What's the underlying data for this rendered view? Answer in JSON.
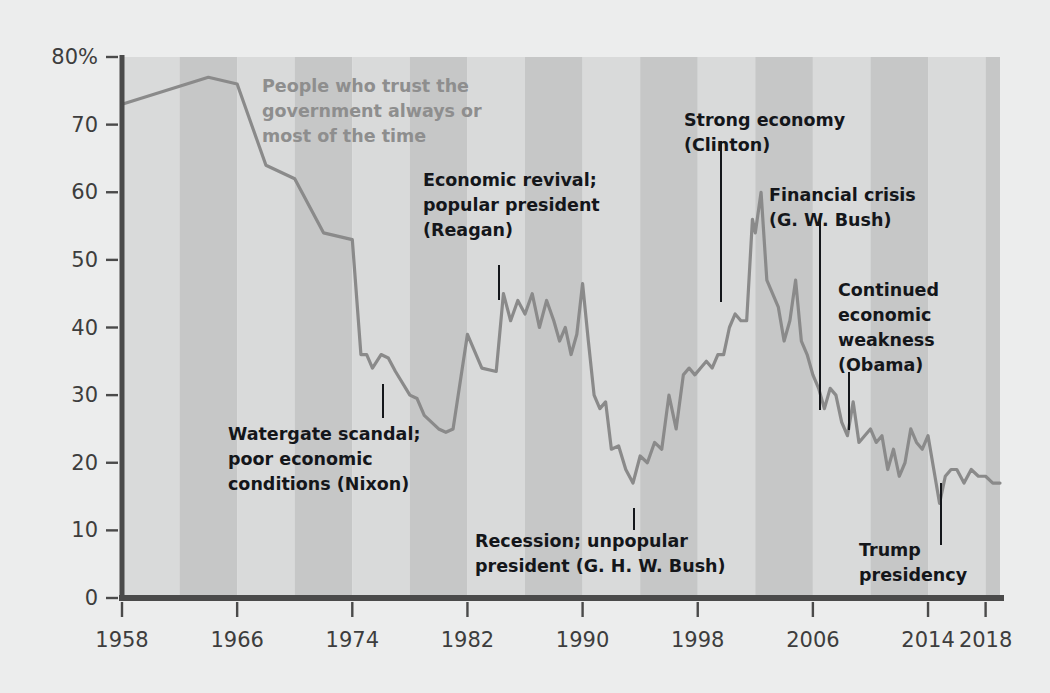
{
  "figure": {
    "background_color": "#eceded",
    "plot_band_light": "#d9dada",
    "plot_band_dark": "#c6c7c7",
    "line_color": "#8a8a8a",
    "axis_color": "#4a4a4a",
    "annotation_color": "#14161a",
    "series_label_color": "#8e8e8e"
  },
  "series_label": {
    "line1": "People who trust the",
    "line2": "government always or",
    "line3": "most of the time"
  },
  "annotations": [
    {
      "id": "watergate",
      "lines": [
        "Watergate scandal;",
        "poor economic",
        "conditions (Nixon)"
      ],
      "anchor_year": 1974.5,
      "anchor_value": 34,
      "text_x": 228,
      "text_y": 440,
      "align": "start",
      "leader": {
        "x": 383,
        "y1": 384,
        "y2": 418
      }
    },
    {
      "id": "reagan",
      "lines": [
        "Economic revival;",
        "popular president",
        "(Reagan)"
      ],
      "anchor_year": 1984,
      "anchor_value": 45,
      "text_x": 423,
      "text_y": 186,
      "align": "start",
      "leader": {
        "x": 499,
        "y1": 265,
        "y2": 300
      }
    },
    {
      "id": "ghw-bush",
      "lines": [
        "Recession; unpopular",
        "president (G. H. W. Bush)"
      ],
      "anchor_year": 1994,
      "anchor_value": 18,
      "text_x": 475,
      "text_y": 547,
      "align": "start",
      "leader": {
        "x": 634,
        "y1": 508,
        "y2": 530
      }
    },
    {
      "id": "clinton",
      "lines": [
        "Strong economy",
        "(Clinton)"
      ],
      "anchor_year": 2000,
      "anchor_value": 42,
      "text_x": 684,
      "text_y": 126,
      "align": "start",
      "leader": {
        "x": 721,
        "y1": 141,
        "y2": 302
      }
    },
    {
      "id": "gw-bush",
      "lines": [
        "Financial crisis",
        "(G. W. Bush)"
      ],
      "anchor_year": 2007,
      "anchor_value": 27,
      "text_x": 769,
      "text_y": 201,
      "align": "start",
      "leader": {
        "x": 820,
        "y1": 218,
        "y2": 410
      }
    },
    {
      "id": "obama",
      "lines": [
        "Continued",
        "economic",
        "weakness",
        "(Obama)"
      ],
      "anchor_year": 2010,
      "anchor_value": 24,
      "text_x": 838,
      "text_y": 296,
      "align": "start",
      "leader": {
        "x": 849,
        "y1": 372,
        "y2": 430
      }
    },
    {
      "id": "trump",
      "lines": [
        "Trump",
        "presidency"
      ],
      "anchor_year": 2016,
      "anchor_value": 18,
      "text_x": 859,
      "text_y": 556,
      "align": "start",
      "leader": {
        "x": 941,
        "y1": 483,
        "y2": 545
      }
    }
  ],
  "chart_data": {
    "type": "line",
    "title": "",
    "subtitle": "",
    "xlabel": "",
    "ylabel": "",
    "ylim": [
      0,
      80
    ],
    "xlim": [
      1958,
      2019
    ],
    "grid": false,
    "legend_position": "inline-label",
    "y_ticks": [
      0,
      10,
      20,
      30,
      40,
      50,
      60,
      70,
      80
    ],
    "y_tick_labels": [
      "0",
      "10",
      "20",
      "30",
      "40",
      "50",
      "60",
      "70",
      "80%"
    ],
    "x_ticks": [
      1958,
      1966,
      1974,
      1982,
      1990,
      1998,
      2006,
      2014,
      2018
    ],
    "x_tick_labels": [
      "1958",
      "1966",
      "1974",
      "1982",
      "1990",
      "1998",
      "2006",
      "2014",
      "2018"
    ],
    "band_boundaries": [
      1958,
      1962,
      1966,
      1970,
      1974,
      1978,
      1982,
      1986,
      1990,
      1994,
      1998,
      2002,
      2006,
      2010,
      2014,
      2018,
      2019
    ],
    "series": [
      {
        "name": "People who trust the government always or most of the time",
        "color": "#8a8a8a",
        "x": [
          1958,
          1964,
          1966,
          1968,
          1970,
          1972,
          1974,
          1974.6,
          1975,
          1975.4,
          1976,
          1976.5,
          1977,
          1978,
          1978.5,
          1979,
          1980,
          1980.5,
          1981,
          1982,
          1983,
          1984,
          1984.5,
          1985,
          1985.5,
          1986,
          1986.5,
          1987,
          1987.5,
          1988,
          1988.4,
          1988.8,
          1989.2,
          1989.6,
          1990,
          1990.4,
          1990.8,
          1991.2,
          1991.6,
          1992,
          1992.5,
          1993,
          1993.5,
          1994,
          1994.5,
          1995,
          1995.5,
          1996,
          1996.5,
          1997,
          1997.4,
          1997.8,
          1998.2,
          1998.6,
          1999,
          1999.4,
          1999.8,
          2000.2,
          2000.6,
          2001,
          2001.4,
          2001.8,
          2002,
          2002.4,
          2002.8,
          2003.2,
          2003.6,
          2004,
          2004.4,
          2004.8,
          2005.2,
          2005.6,
          2006,
          2006.4,
          2006.8,
          2007.2,
          2007.6,
          2008,
          2008.4,
          2008.8,
          2009.2,
          2009.6,
          2010,
          2010.4,
          2010.8,
          2011.2,
          2011.6,
          2012,
          2012.4,
          2012.8,
          2013.2,
          2013.6,
          2014,
          2014.4,
          2014.8,
          2015.2,
          2015.6,
          2016,
          2016.5,
          2017,
          2017.5,
          2018,
          2018.5,
          2019
        ],
        "y": [
          73,
          77,
          76,
          64,
          62,
          54,
          53,
          36,
          36,
          34,
          36,
          35.5,
          33.5,
          30,
          29.5,
          27,
          25,
          24.5,
          25,
          39,
          34,
          33.5,
          45,
          41,
          44,
          42,
          45,
          40,
          44,
          41,
          38,
          40,
          36,
          39,
          46.5,
          38,
          30,
          28,
          29,
          22,
          22.5,
          19,
          17,
          21,
          20,
          23,
          22,
          30,
          25,
          33,
          34,
          33,
          34,
          35,
          34,
          36,
          36,
          40,
          42,
          41,
          41,
          56,
          54,
          60,
          47,
          45,
          43,
          38,
          41,
          47,
          38,
          36,
          33,
          31,
          28,
          31,
          30,
          26,
          24,
          29,
          23,
          24,
          25,
          23,
          24,
          19,
          22,
          18,
          20,
          25,
          23,
          22,
          24,
          19,
          14,
          18,
          19,
          19,
          17,
          19,
          18,
          18,
          17,
          17
        ]
      }
    ],
    "annotation_summary": [
      "Watergate scandal; poor economic conditions (Nixon)",
      "Economic revival; popular president (Reagan)",
      "Recession; unpopular president (G. H. W. Bush)",
      "Strong economy (Clinton)",
      "Financial crisis (G. W. Bush)",
      "Continued economic weakness (Obama)",
      "Trump presidency"
    ]
  }
}
